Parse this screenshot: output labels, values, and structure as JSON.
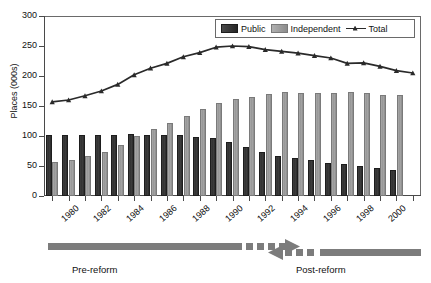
{
  "chart_data": {
    "type": "bar",
    "title": "",
    "xlabel": "",
    "ylabel": "Places (000s)",
    "ylim": [
      0,
      300
    ],
    "yticks": [
      0,
      50,
      100,
      150,
      200,
      250,
      300
    ],
    "grid": false,
    "legend_position": "top-right",
    "legend": [
      "Public",
      "Independent",
      "Total"
    ],
    "categories": [
      "1979",
      "1980",
      "1981",
      "1982",
      "1983",
      "1984",
      "1985",
      "1986",
      "1987",
      "1988",
      "1989",
      "1990",
      "1991",
      "1992",
      "1993",
      "1994",
      "1995",
      "1996",
      "1997",
      "1998",
      "1999",
      "2000",
      "2001"
    ],
    "tick_labels": [
      "1980",
      "1982",
      "1984",
      "1986",
      "1988",
      "1990",
      "1992",
      "1994",
      "1996",
      "1998",
      "2000"
    ],
    "series": [
      {
        "name": "Public",
        "type": "bar",
        "color": "#333333",
        "values": [
          101,
          101,
          102,
          102,
          102,
          103,
          102,
          102,
          101,
          99,
          96,
          90,
          81,
          73,
          67,
          63,
          60,
          55,
          53,
          50,
          46,
          43,
          0
        ]
      },
      {
        "name": "Independent",
        "type": "bar",
        "color": "#999999",
        "values": [
          57,
          60,
          67,
          73,
          85,
          100,
          112,
          122,
          133,
          145,
          155,
          161,
          165,
          170,
          173,
          172,
          172,
          171,
          173,
          171,
          168,
          168,
          0
        ]
      },
      {
        "name": "Total",
        "type": "line",
        "color": "#2a2a2a",
        "marker": "triangle",
        "values": [
          157,
          160,
          167,
          175,
          186,
          202,
          213,
          221,
          232,
          239,
          248,
          250,
          249,
          244,
          241,
          238,
          234,
          230,
          221,
          222,
          216,
          209,
          205
        ]
      }
    ],
    "annotations": [
      {
        "name": "pre-reform-arrow",
        "label": "Pre-reform",
        "direction": "right",
        "style": "solid-then-dashed"
      },
      {
        "name": "post-reform-arrow",
        "label": "Post-reform",
        "direction": "left",
        "style": "dashed-then-solid"
      }
    ]
  },
  "axis": {
    "y_title": "Places (000s)"
  },
  "legend": {
    "public": "Public",
    "independent": "Independent",
    "total": "Total"
  },
  "annotations": {
    "pre_reform": "Pre-reform",
    "post_reform": "Post-reform"
  }
}
